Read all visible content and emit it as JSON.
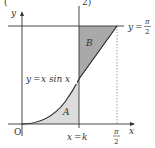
{
  "figure": {
    "clipped_header": {
      "left": "(",
      "right": "2)"
    },
    "axes": {
      "x_label": "x",
      "y_label": "y",
      "origin_label": "O"
    },
    "curve": {
      "equation_label": "y = x sin x",
      "lhs": "y",
      "eq": "=",
      "rhs": "x sin x"
    },
    "horizontal_line": {
      "label_lhs": "y",
      "eq": "=",
      "num": "π",
      "den": "2"
    },
    "vertical_line": {
      "label": "x = k",
      "lhs": "x",
      "eq": "=",
      "rhs": "k"
    },
    "x_tick": {
      "num": "π",
      "den": "2"
    },
    "regions": [
      {
        "name": "A",
        "label": "A",
        "description": "area under y = x sin x from 0 to k",
        "fill": "#dcdcdc"
      },
      {
        "name": "B",
        "label": "B",
        "description": "area between y = π/2 and curve from k to π/2",
        "fill": "#a9a9a9"
      }
    ],
    "colors": {
      "line": "#333333",
      "region_A": "#dcdcdc",
      "region_B": "#a9a9a9",
      "dotted": "#888888"
    }
  }
}
